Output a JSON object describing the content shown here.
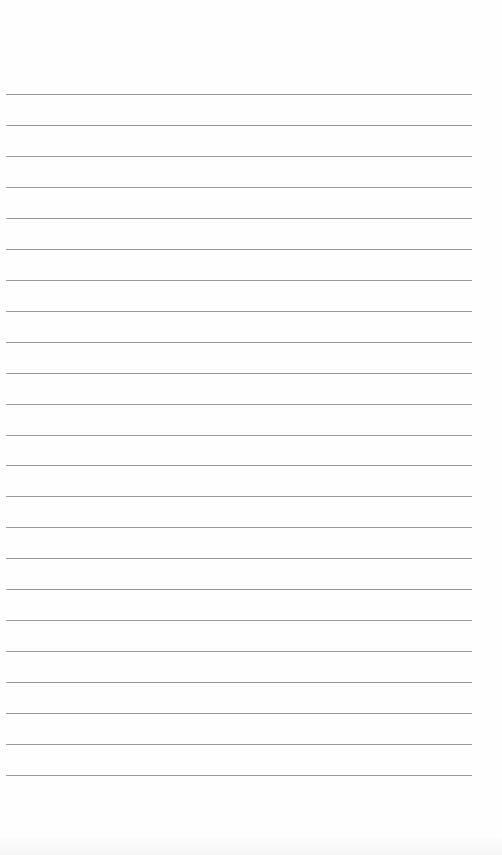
{
  "page": {
    "type": "lined-paper",
    "background_color": "#fefefe",
    "line_color": "#9a9a9a",
    "line_count": 23,
    "first_line_y": 94,
    "line_spacing": 31,
    "line_left": 6,
    "line_width": 466
  }
}
